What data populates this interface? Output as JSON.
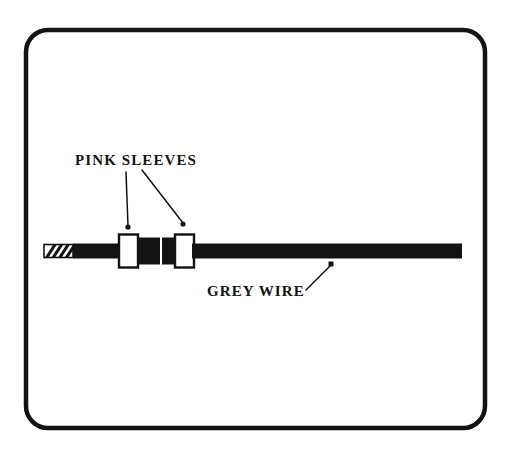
{
  "figure": {
    "background_color": "#ffffff",
    "ink_color": "#131313",
    "border": {
      "name": "rounded-frame",
      "x": 26,
      "y": 30,
      "width": 459,
      "height": 398,
      "corner_radius": 22,
      "stroke_width": 4.5,
      "color": "#131313"
    }
  },
  "labels": [
    {
      "id": "pink-sleeves",
      "text": "PINK SLEEVES",
      "x": 75,
      "y": 165,
      "anchor": "start"
    },
    {
      "id": "grey-wire",
      "text": "GREY WIRE",
      "x": 207,
      "y": 296,
      "anchor": "start"
    }
  ],
  "leaders": [
    {
      "id": "leader-sleeve-left",
      "from_label": "PINK SLEEVES",
      "x1": 126,
      "y1": 172,
      "x2": 128,
      "y2": 226,
      "dot_x": 128,
      "dot_y": 227,
      "dot_r": 2.6
    },
    {
      "id": "leader-sleeve-right",
      "from_label": "PINK SLEEVES",
      "x1": 142,
      "y1": 170,
      "x2": 183,
      "y2": 223,
      "dot_x": 183,
      "dot_y": 224,
      "dot_r": 2.6
    },
    {
      "id": "leader-grey-wire",
      "from_label": "GREY WIRE",
      "x1": 306,
      "y1": 290,
      "x2": 330,
      "y2": 266,
      "dot_x": 331,
      "dot_y": 264,
      "dot_size": 5
    }
  ],
  "cable": {
    "name": "cable-assembly",
    "axis_y": 251,
    "body_color": "#131313",
    "segments": [
      {
        "id": "stripped-tip",
        "type": "hatched-tip",
        "x": 44,
        "width": 29,
        "height": 13,
        "hatch_count": 4,
        "hatch_angle_deg": 58
      },
      {
        "id": "wire-left-of-sleeve-1",
        "type": "wire",
        "x": 73,
        "width": 48,
        "height": 15
      },
      {
        "id": "pink-sleeve-1",
        "type": "sleeve",
        "x": 119,
        "width": 19,
        "height": 33,
        "fill": "#ffffff",
        "stroke": "#131313",
        "stroke_width": 2.4
      },
      {
        "id": "crimp-block-1",
        "type": "block",
        "x": 139,
        "width": 21,
        "height": 27,
        "fill": "#131313"
      },
      {
        "id": "crimp-block-2",
        "type": "block",
        "x": 162,
        "width": 21,
        "height": 27,
        "fill": "#131313"
      },
      {
        "id": "pink-sleeve-2",
        "type": "sleeve",
        "x": 175,
        "width": 19,
        "height": 33,
        "fill": "#ffffff",
        "stroke": "#131313",
        "stroke_width": 2.4
      },
      {
        "id": "grey-wire-run",
        "type": "wire",
        "x": 192,
        "width": 270,
        "height": 15
      }
    ]
  }
}
